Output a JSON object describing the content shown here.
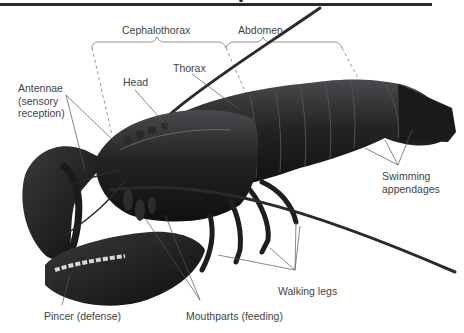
{
  "diagram": {
    "title_fragment": "p",
    "regions": [
      {
        "id": "cephalothorax",
        "label": "Cephalothorax"
      },
      {
        "id": "abdomen",
        "label": "Abdomen"
      }
    ],
    "labels": {
      "cephalothorax": "Cephalothorax",
      "abdomen": "Abdomen",
      "head": "Head",
      "thorax": "Thorax",
      "antennae_line1": "Antennae",
      "antennae_line2": "(sensory",
      "antennae_line3": "reception)",
      "swimming_line1": "Swimming",
      "swimming_line2": "appendages",
      "walking_legs": "Walking legs",
      "pincer": "Pincer (defense)",
      "mouthparts": "Mouthparts (feeding)"
    },
    "colors": {
      "body": "#1c1c1e",
      "body_highlight": "#4a4a4e",
      "label_text": "#444444",
      "leader_line": "#555555",
      "rule": "#2a2a2a"
    }
  }
}
